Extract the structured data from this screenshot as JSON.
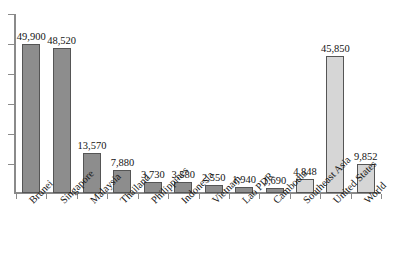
{
  "chart_data": {
    "type": "bar",
    "title": "",
    "subtitle": "",
    "xlabel": "",
    "ylabel": "",
    "ylim": [
      0,
      60000
    ],
    "grid": false,
    "legend": "none",
    "y_axis_tick_labels": [],
    "y_axis_tick_count": 6,
    "categories": [
      "Brunei",
      "Singapore",
      "Malaysia",
      "Thailand",
      "Philippines",
      "Indonesia",
      "Vietnam",
      "Lao PDR",
      "Cambodia",
      "Southeast Asia",
      "United States",
      "World"
    ],
    "values": [
      49900,
      48520,
      13570,
      7880,
      3730,
      3580,
      2550,
      1940,
      1690,
      4848,
      45850,
      9852
    ],
    "data_labels": [
      "49,900",
      "48,520",
      "13,570",
      "7,880",
      "3,730",
      "3,580",
      "2,550",
      "1,940",
      "1,690",
      "4,848",
      "45,850",
      "9,852"
    ],
    "bar_shades": [
      "dark",
      "dark",
      "dark",
      "dark",
      "dark",
      "dark",
      "dark",
      "dark",
      "dark",
      "light",
      "light",
      "light"
    ],
    "colors": {
      "bar_dark": "#8d8d8d",
      "bar_light": "#d6d6d6",
      "bar_border": "#555555",
      "axis": "#8a8a8a",
      "text": "#141414"
    }
  }
}
